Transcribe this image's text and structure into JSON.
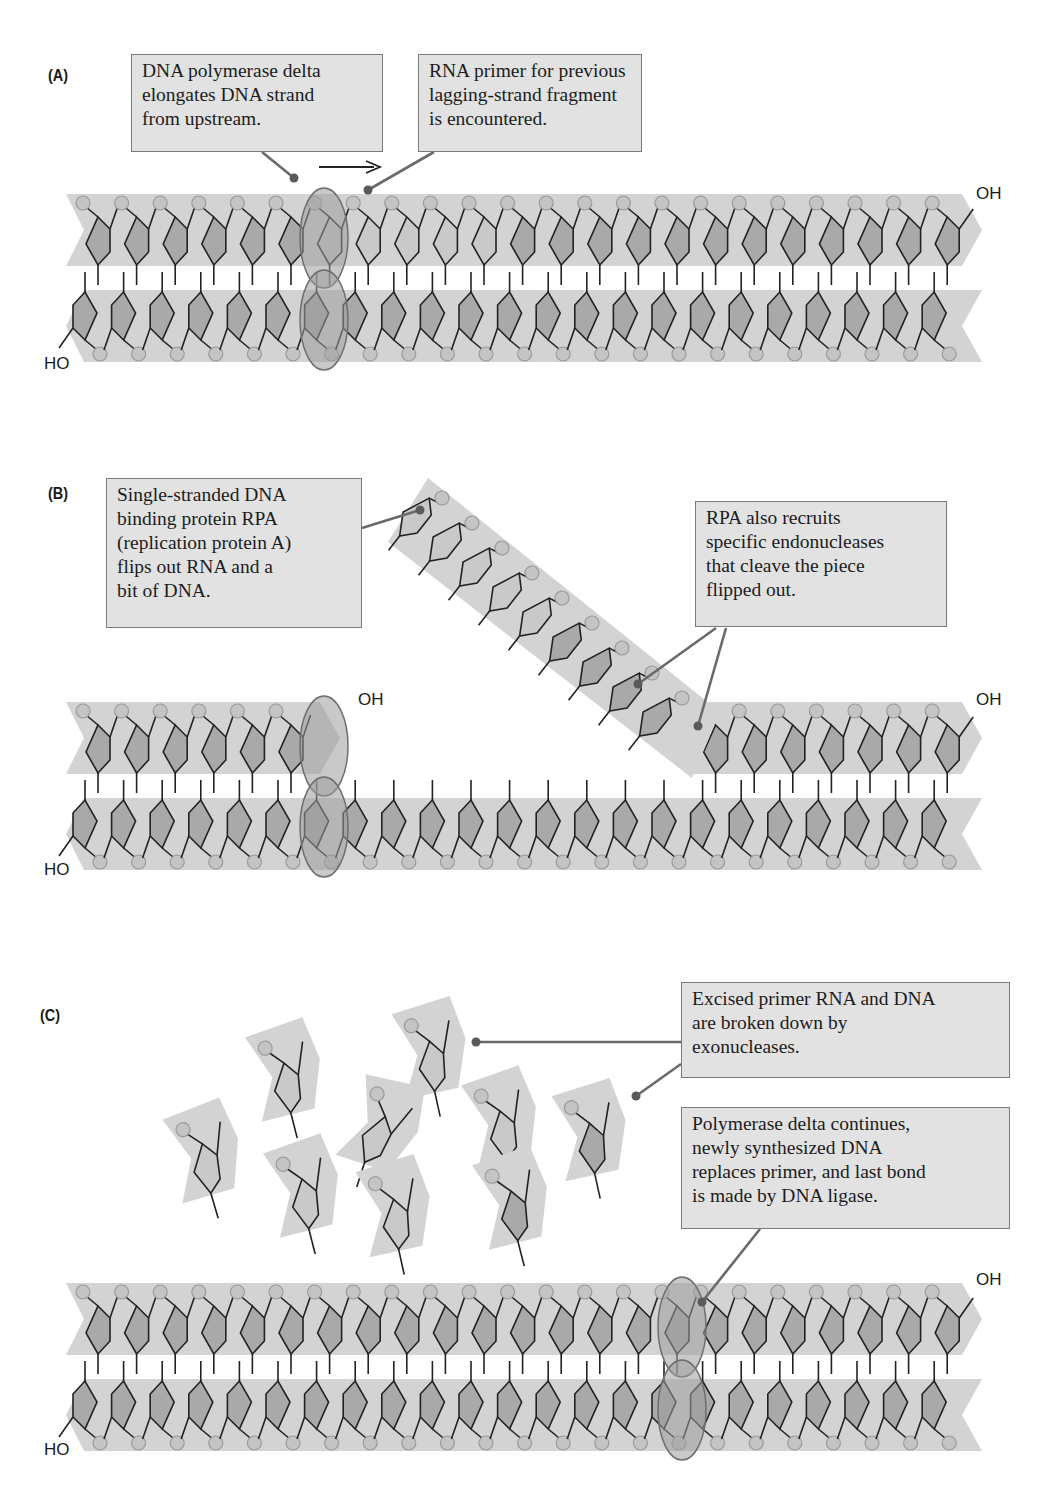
{
  "figure": {
    "panels": [
      {
        "id": "A",
        "label": "(A)",
        "callouts": [
          {
            "name": "polymerase-delta-callout",
            "lines": [
              "DNA polymerase delta",
              "elongates DNA strand",
              "from upstream."
            ]
          },
          {
            "name": "rna-primer-callout",
            "lines": [
              "RNA primer for previous",
              "lagging-strand fragment",
              "is encountered."
            ]
          }
        ],
        "end_labels": {
          "top_right": "OH",
          "bottom_left": "HO"
        }
      },
      {
        "id": "B",
        "label": "(B)",
        "callouts": [
          {
            "name": "rpa-flip-callout",
            "lines": [
              "Single-stranded DNA",
              "binding protein RPA",
              "(replication protein A)",
              "flips out RNA and a",
              "bit of DNA."
            ]
          },
          {
            "name": "endonuclease-callout",
            "lines": [
              "RPA also recruits",
              "specific endonucleases",
              "that cleave the piece",
              "flipped out."
            ]
          }
        ],
        "end_labels": {
          "top_middle": "OH",
          "top_right": "OH",
          "bottom_left": "HO"
        }
      },
      {
        "id": "C",
        "label": "(C)",
        "callouts": [
          {
            "name": "exonuclease-callout",
            "lines": [
              "Excised primer RNA and DNA",
              "are broken down by",
              "exonucleases."
            ]
          },
          {
            "name": "ligase-callout",
            "lines": [
              "Polymerase delta continues,",
              "newly synthesized DNA",
              "replaces primer, and last bond",
              "is made by DNA ligase."
            ]
          }
        ],
        "end_labels": {
          "top_right": "OH",
          "bottom_left": "HO"
        }
      }
    ],
    "colors": {
      "background": "#ffffff",
      "strand_band": "#d3d3d3",
      "phosphate_fill": "#c4c4c4",
      "phosphate_stroke": "#9a9a9a",
      "sugar_dna_fill": "#a9a9a9",
      "sugar_rna_fill": "#c9c9c9",
      "bond_line": "#222222",
      "polymerase_fill": "#9d9d9d",
      "polymerase_stroke": "#6f6f6f",
      "callout_fill": "#e2e2e2",
      "callout_border": "#7a7a7a",
      "leader_line": "#6a6a6a",
      "leader_dot": "#5a5a5a"
    }
  }
}
